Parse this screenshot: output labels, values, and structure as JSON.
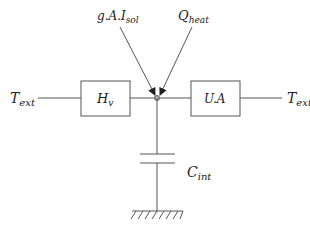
{
  "diagram": {
    "type": "thermal RC network",
    "inputs": {
      "left_temperature": {
        "base": "T",
        "sub": "ext"
      },
      "right_temperature": {
        "base": "T",
        "sub": "ext"
      },
      "solar_gain": {
        "base": "g.A.I",
        "sub": "sol"
      },
      "heat_input": {
        "base": "Q",
        "sub": "heat"
      }
    },
    "elements": {
      "ventilation_conductance": {
        "base": "H",
        "sub": "v"
      },
      "envelope_conductance": {
        "label": "U.A"
      },
      "internal_capacitance": {
        "base": "C",
        "sub": "int"
      }
    },
    "node": {
      "name": "internal node",
      "color": "#999999"
    },
    "ground": {
      "name": "ground reference"
    },
    "colors": {
      "line": "#555555",
      "text": "#222222",
      "background": "#ffffff"
    }
  }
}
